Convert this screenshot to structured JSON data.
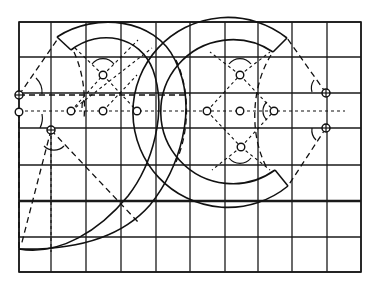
{
  "diagram": {
    "colors": {
      "ink": "#111111",
      "paper": "#ffffff"
    },
    "grid": {
      "x": [
        19,
        51,
        86,
        121,
        156,
        190,
        225,
        258,
        292,
        327,
        361
      ],
      "y": [
        22,
        57,
        93,
        128,
        165,
        201,
        237,
        272
      ],
      "thick_row_y": 201,
      "columns": 10,
      "rows": 7
    },
    "guide_lines": {
      "long_dashed_horizontal": {
        "y": 95,
        "x1": 19,
        "x2": 190
      },
      "short_dashed_horizontal": {
        "y": 111,
        "x1": 19,
        "x2": 345
      }
    },
    "construction_points": {
      "left_glyph": [
        {
          "x": 103,
          "y": 75,
          "type": "open"
        },
        {
          "x": 71,
          "y": 111,
          "type": "open"
        },
        {
          "x": 103,
          "y": 111,
          "type": "open"
        },
        {
          "x": 137,
          "y": 111,
          "type": "open"
        },
        {
          "x": 19,
          "y": 95,
          "type": "crossed"
        },
        {
          "x": 19,
          "y": 112,
          "type": "open"
        },
        {
          "x": 51,
          "y": 130,
          "type": "crossed"
        }
      ],
      "right_glyph": [
        {
          "x": 240,
          "y": 75,
          "type": "open"
        },
        {
          "x": 207,
          "y": 111,
          "type": "open"
        },
        {
          "x": 240,
          "y": 111,
          "type": "open"
        },
        {
          "x": 274,
          "y": 111,
          "type": "open"
        },
        {
          "x": 241,
          "y": 147,
          "type": "open"
        },
        {
          "x": 326,
          "y": 93,
          "type": "crossed"
        },
        {
          "x": 326,
          "y": 128,
          "type": "crossed"
        }
      ]
    }
  }
}
